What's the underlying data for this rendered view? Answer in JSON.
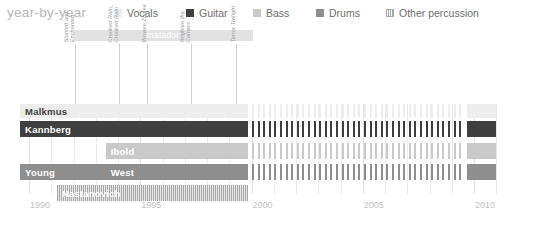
{
  "header": {
    "title": "year-by-year",
    "legend": [
      {
        "label": "Vocals",
        "color": "#ededed",
        "pattern": "solid",
        "x": 114
      },
      {
        "label": "Guitar",
        "color": "#3f3f3f",
        "pattern": "solid",
        "x": 186
      },
      {
        "label": "Bass",
        "color": "#c9c9c9",
        "pattern": "solid",
        "x": 253
      },
      {
        "label": "Drums",
        "color": "#8e8e8e",
        "pattern": "solid",
        "x": 316
      },
      {
        "label": "Other percussion",
        "color": "#a8a8a8",
        "pattern": "striped",
        "x": 386
      }
    ]
  },
  "annotations": {
    "label_band": {
      "text": "matador",
      "start_year": 1992.0,
      "end_year": 2000.05,
      "color": "#e2e2e2",
      "text_color": "#ffffff"
    },
    "albums": [
      {
        "lines": [
          "Slanted and",
          "Enchanted"
        ],
        "year": 1992.05
      },
      {
        "lines": [
          "Crooked Rain,",
          "Crooked Rain"
        ],
        "year": 1994.05
      },
      {
        "lines": [
          "Wowee Zowee"
        ],
        "year": 1995.3
      },
      {
        "lines": [
          "Brighten the",
          "Corners"
        ],
        "year": 1997.3
      },
      {
        "lines": [
          "Terror Twilight"
        ],
        "year": 1999.3
      }
    ]
  },
  "chart_data": {
    "type": "timeline",
    "title": "year-by-year",
    "xlabel": "",
    "ylabel": "",
    "xlim": [
      1989.5,
      2011.0
    ],
    "xticks": [
      1990,
      1995,
      2000,
      2005,
      2010
    ],
    "xtick_labels": [
      "1990",
      "1995",
      "2000",
      "2005",
      "2010"
    ],
    "minor_tick_interval": 1,
    "grid": true,
    "legend_position": "top",
    "rows": [
      {
        "name": "Malkmus",
        "top": 0,
        "height": 14,
        "segments": [
          {
            "label": "Malkmus",
            "role": "Vocals",
            "color": "#ededed",
            "pattern": "solid",
            "start": 1989.6,
            "end": 1999.85,
            "label_color": "dark"
          },
          {
            "label": "",
            "role": "Vocals",
            "color": "#ededed",
            "pattern": "dashed",
            "start": 2000.0,
            "end": 2009.55,
            "label_color": "dark"
          },
          {
            "label": "",
            "role": "Vocals",
            "color": "#ededed",
            "pattern": "solid",
            "start": 2009.7,
            "end": 2011.0,
            "label_color": "dark"
          }
        ]
      },
      {
        "name": "Kannberg",
        "top": 17,
        "height": 16,
        "segments": [
          {
            "label": "Kannberg",
            "role": "Guitar",
            "color": "#3f3f3f",
            "pattern": "solid",
            "start": 1989.6,
            "end": 1999.85,
            "label_color": "light"
          },
          {
            "label": "",
            "role": "Guitar",
            "color": "#3f3f3f",
            "pattern": "dashed",
            "start": 2000.0,
            "end": 2009.55,
            "label_color": "light"
          },
          {
            "label": "",
            "role": "Guitar",
            "color": "#3f3f3f",
            "pattern": "solid",
            "start": 2009.7,
            "end": 2011.0,
            "label_color": "light"
          }
        ]
      },
      {
        "name": "Ibold",
        "top": 39,
        "height": 16,
        "segments": [
          {
            "label": "Ibold",
            "role": "Bass",
            "color": "#c9c9c9",
            "pattern": "solid",
            "start": 1993.45,
            "end": 1999.85,
            "label_color": "light"
          },
          {
            "label": "",
            "role": "Bass",
            "color": "#c9c9c9",
            "pattern": "dashed",
            "start": 2000.0,
            "end": 2009.55,
            "label_color": "light"
          },
          {
            "label": "",
            "role": "Bass",
            "color": "#c9c9c9",
            "pattern": "solid",
            "start": 2009.7,
            "end": 2011.0,
            "label_color": "light"
          }
        ]
      },
      {
        "name": "Young / West",
        "top": 60,
        "height": 16,
        "segments": [
          {
            "label": "Young",
            "role": "Drums",
            "color": "#8e8e8e",
            "pattern": "solid",
            "start": 1989.6,
            "end": 1993.45,
            "label_color": "light"
          },
          {
            "label": "West",
            "role": "Drums",
            "color": "#8e8e8e",
            "pattern": "solid",
            "start": 1993.45,
            "end": 1999.85,
            "label_color": "light"
          },
          {
            "label": "",
            "role": "Drums",
            "color": "#8e8e8e",
            "pattern": "dashed",
            "start": 2000.0,
            "end": 2009.55,
            "label_color": "light"
          },
          {
            "label": "",
            "role": "Drums",
            "color": "#8e8e8e",
            "pattern": "solid",
            "start": 2009.7,
            "end": 2011.0,
            "label_color": "light"
          }
        ]
      },
      {
        "name": "Nastanovich",
        "top": 81,
        "height": 16,
        "segments": [
          {
            "label": "Nastanovich",
            "role": "Other percussion",
            "color": "#a8a8a8",
            "pattern": "striped",
            "start": 1991.25,
            "end": 1999.85,
            "label_color": "light"
          }
        ]
      }
    ]
  }
}
